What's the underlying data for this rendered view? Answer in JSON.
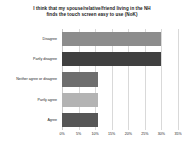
{
  "chart_data": {
    "type": "bar",
    "orientation": "horizontal",
    "title": "I think that my spouse/relative/friend living in the NH finds the touch screen easy to use (NoK)",
    "title_line1": "I think that my spouse/relative/friend living in the NH",
    "title_line2": "finds the touch screen easy to use (NoK)",
    "xlabel": "",
    "ylabel": "",
    "categories": [
      "Disagree",
      "Partly disagree",
      "Neither agree or disagree",
      "Partly agree",
      "Agree"
    ],
    "values": [
      30,
      30,
      11,
      11,
      11
    ],
    "value_labels": [
      "30%",
      "30%",
      "11%",
      "11%",
      "11%"
    ],
    "bar_colors": [
      "#8c8c8c",
      "#404040",
      "#6e6e6e",
      "#b3b3b3",
      "#565656"
    ],
    "xlim": [
      0,
      35
    ],
    "xticks": [
      0,
      5,
      10,
      15,
      20,
      25,
      30,
      35
    ],
    "xtick_labels": [
      "0%",
      "5%",
      "10%",
      "15%",
      "20%",
      "25%",
      "30%",
      "35%"
    ],
    "grid": "vertical",
    "legend": "none",
    "background": "#ffffff"
  }
}
